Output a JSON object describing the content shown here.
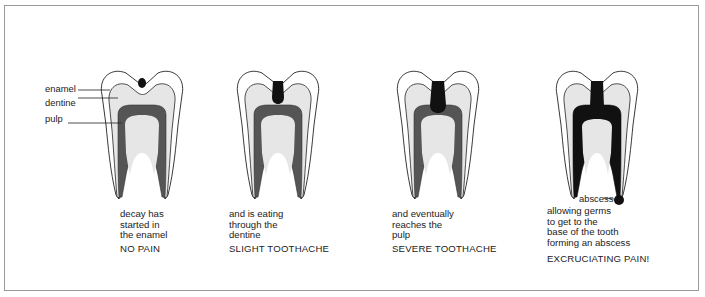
{
  "diagram": {
    "title_visible": false,
    "colors": {
      "enamel": "#ffffff",
      "dentine": "#e6e6e6",
      "pulp": "#555555",
      "decay": "#111111",
      "outline": "#222222",
      "frame_border": "#9a9a9a"
    },
    "labels": {
      "enamel": "enamel",
      "dentine": "dentine",
      "pulp": "pulp",
      "abscess": "abscess"
    },
    "stages": [
      {
        "caption_lines": [
          "decay has",
          "started in",
          "the enamel"
        ],
        "pain": "NO PAIN"
      },
      {
        "caption_lines": [
          "and is eating",
          "through the",
          "dentine"
        ],
        "pain": "SLIGHT TOOTHACHE"
      },
      {
        "caption_lines": [
          "and eventually",
          "reaches the",
          "pulp"
        ],
        "pain": "SEVERE TOOTHACHE"
      },
      {
        "caption_lines": [
          "allowing germs",
          "to get to the",
          "base of the tooth",
          "forming an abscess"
        ],
        "pain": "EXCRUCIATING PAIN!"
      }
    ]
  }
}
